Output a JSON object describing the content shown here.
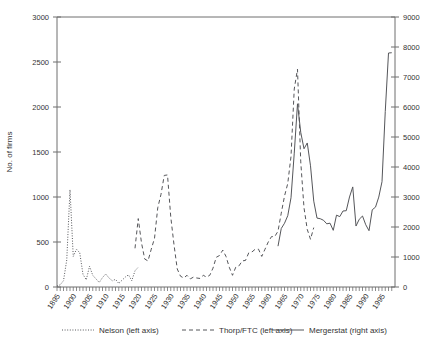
{
  "chart_data": {
    "type": "line",
    "title": "",
    "xlabel": "",
    "ylabel": "No. of  firms",
    "ylabel_right": "",
    "xlim": [
      1895,
      1999
    ],
    "ylim": [
      0,
      3000
    ],
    "ylim_right": [
      0,
      9000
    ],
    "yticks": [
      0,
      500,
      1000,
      1500,
      2000,
      2500,
      3000
    ],
    "yticks_right": [
      0,
      1000,
      2000,
      3000,
      4000,
      5000,
      6000,
      7000,
      8000,
      9000
    ],
    "xticks": [
      1895,
      1900,
      1905,
      1910,
      1915,
      1920,
      1925,
      1930,
      1935,
      1940,
      1945,
      1950,
      1955,
      1960,
      1965,
      1970,
      1975,
      1980,
      1985,
      1990,
      1995
    ],
    "grid": false,
    "legend_position": "bottom",
    "series": [
      {
        "name": "Nelson (left axis)",
        "axis": "left",
        "style": "dotted",
        "color": "#55565a",
        "x": [
          1895,
          1896,
          1897,
          1898,
          1899,
          1900,
          1901,
          1902,
          1903,
          1904,
          1905,
          1906,
          1907,
          1908,
          1909,
          1910,
          1911,
          1912,
          1913,
          1914,
          1915,
          1916,
          1917,
          1918,
          1919,
          1920
        ],
        "values": [
          10,
          25,
          70,
          300,
          1080,
          340,
          420,
          380,
          140,
          80,
          230,
          130,
          90,
          50,
          105,
          145,
          100,
          70,
          85,
          40,
          75,
          110,
          135,
          70,
          180,
          220
        ]
      },
      {
        "name": "Thorp/FTC (left axis)",
        "axis": "left",
        "style": "dashed",
        "color": "#55565a",
        "x": [
          1919,
          1920,
          1921,
          1922,
          1923,
          1924,
          1925,
          1926,
          1927,
          1928,
          1929,
          1930,
          1931,
          1932,
          1933,
          1934,
          1935,
          1936,
          1937,
          1938,
          1939,
          1940,
          1941,
          1942,
          1943,
          1944,
          1945,
          1946,
          1947,
          1948,
          1949,
          1950,
          1951,
          1952,
          1953,
          1954,
          1955,
          1956,
          1957,
          1958,
          1959,
          1960,
          1961,
          1962,
          1963,
          1964,
          1965,
          1966,
          1967,
          1968,
          1969,
          1970,
          1971,
          1972,
          1973,
          1974
        ],
        "values": [
          430,
          760,
          490,
          310,
          290,
          420,
          540,
          880,
          1030,
          1240,
          1245,
          780,
          470,
          200,
          120,
          100,
          130,
          90,
          110,
          100,
          95,
          130,
          110,
          130,
          210,
          330,
          350,
          410,
          340,
          220,
          130,
          220,
          235,
          290,
          295,
          380,
          390,
          420,
          420,
          340,
          420,
          500,
          560,
          560,
          620,
          820,
          1010,
          1150,
          1450,
          2200,
          2420,
          1390,
          880,
          640,
          530,
          660
        ]
      },
      {
        "name": "Mergerstat (right axis)",
        "axis": "right",
        "style": "solid",
        "color": "#55565a",
        "x": [
          1963,
          1964,
          1965,
          1966,
          1967,
          1968,
          1969,
          1970,
          1971,
          1972,
          1973,
          1974,
          1975,
          1976,
          1977,
          1978,
          1979,
          1980,
          1981,
          1982,
          1983,
          1984,
          1985,
          1986,
          1987,
          1988,
          1989,
          1990,
          1991,
          1992,
          1993,
          1994,
          1995,
          1996,
          1997,
          1998
        ],
        "values": [
          1361,
          1950,
          2125,
          2377,
          2975,
          4462,
          6107,
          5152,
          4608,
          4801,
          4040,
          2861,
          2297,
          2276,
          2224,
          2106,
          2128,
          1889,
          2395,
          2346,
          2533,
          2543,
          3001,
          3336,
          2032,
          2258,
          2366,
          2074,
          1877,
          2574,
          2663,
          2997,
          3510,
          5848,
          7800,
          7809
        ]
      }
    ]
  },
  "legend": {
    "items": [
      {
        "label": "Nelson (left axis)",
        "style": "dotted"
      },
      {
        "label": "Thorp/FTC (left axis)",
        "style": "dashed"
      },
      {
        "label": "Mergerstat (right axis)",
        "style": "solid"
      }
    ]
  }
}
